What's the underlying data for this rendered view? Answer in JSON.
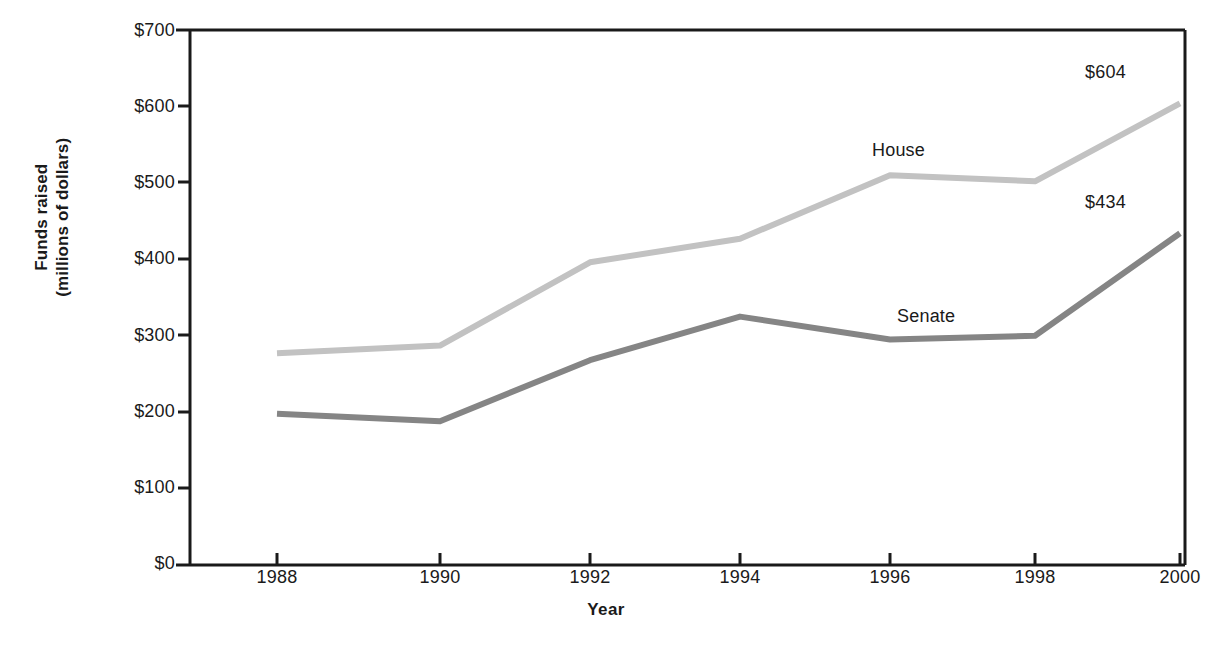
{
  "chart_data": {
    "type": "line",
    "title": "",
    "xlabel": "Year",
    "ylabel": "Funds raised\n(millions of dollars)",
    "ylabel_line1": "Funds raised",
    "ylabel_line2": "(millions of dollars)",
    "categories": [
      "1988",
      "1990",
      "1992",
      "1994",
      "1996",
      "1998",
      "2000"
    ],
    "x": [
      1988,
      1990,
      1992,
      1994,
      1996,
      1998,
      2000
    ],
    "xlim": [
      1987,
      2001
    ],
    "ylim": [
      0,
      700
    ],
    "ytick_labels": [
      "$0",
      "$100",
      "$200",
      "$300",
      "$400",
      "$500",
      "$600",
      "$700"
    ],
    "ytick_values": [
      0,
      100,
      200,
      300,
      400,
      500,
      600,
      700
    ],
    "grid": false,
    "legend_position": "inline-labels",
    "series": [
      {
        "name": "House",
        "color": "#c2c2c2",
        "values": [
          277,
          287,
          396,
          427,
          510,
          502,
          604
        ],
        "end_label": "$604"
      },
      {
        "name": "Senate",
        "color": "#858585",
        "values": [
          198,
          188,
          268,
          325,
          295,
          300,
          434
        ],
        "end_label": "$434"
      }
    ],
    "annotations": [
      {
        "text": "House",
        "series": "House"
      },
      {
        "text": "Senate",
        "series": "Senate"
      },
      {
        "text": "$604",
        "series": "House"
      },
      {
        "text": "$434",
        "series": "Senate"
      }
    ]
  },
  "colors": {
    "house_line": "#c2c2c2",
    "senate_line": "#858585",
    "axis": "#1a1a1a",
    "background": "#ffffff"
  }
}
